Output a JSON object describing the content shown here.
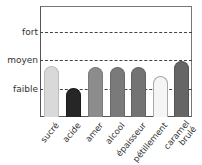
{
  "chart_data": {
    "type": "bar",
    "title": "",
    "xlabel": "",
    "ylabel": "",
    "categories": [
      "sucré",
      "acide",
      "amer",
      "alcool",
      "épaisseur",
      "pétillement",
      "caramel brulé"
    ],
    "category_lines": [
      [
        "sucré"
      ],
      [
        "acide"
      ],
      [
        "amer"
      ],
      [
        "alcool"
      ],
      [
        "épaisseur"
      ],
      [
        "pétillement"
      ],
      [
        "caramel",
        "brulé"
      ]
    ],
    "values": [
      1.8,
      1.0,
      1.75,
      1.75,
      1.75,
      1.45,
      1.95
    ],
    "colors": [
      "#d9d9d9",
      "#262626",
      "#8c8c8c",
      "#7a7a7a",
      "#737373",
      "#f5f5f5",
      "#666666"
    ],
    "border_colors": [
      "#bdbdbd",
      "#1a1a1a",
      "#7a7a7a",
      "#6a6a6a",
      "#636363",
      "#a8a8a8",
      "#555555"
    ],
    "yticks": [
      {
        "value": 1,
        "label": "faible"
      },
      {
        "value": 2,
        "label": "moyen"
      },
      {
        "value": 3,
        "label": "fort"
      }
    ],
    "ylim": [
      0,
      3.9
    ],
    "grid": "dashed horizontal at tick levels",
    "legend": null
  }
}
